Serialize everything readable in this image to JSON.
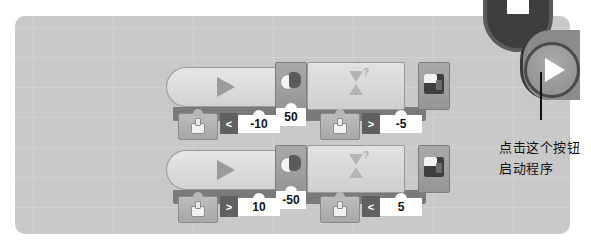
{
  "window": {
    "description": "Graphical robot programming canvas with two looping rows of blocks"
  },
  "program": {
    "rows": [
      {
        "start_block": {
          "icon": "play-triangle-icon"
        },
        "sensor_condition": {
          "icon": "sensor-icon",
          "operator": "<",
          "value": "-10"
        },
        "motor_block": {
          "icon": "motor-icon",
          "power": "50"
        },
        "wait_block": {
          "icon": "hourglass-question-icon",
          "sensor_icon": "sensor-icon",
          "operator": ">",
          "value": "-5"
        },
        "brick_block": {
          "icon": "brick-icon"
        }
      },
      {
        "start_block": {
          "icon": "play-triangle-icon"
        },
        "sensor_condition": {
          "icon": "sensor-icon",
          "operator": ">",
          "value": "10"
        },
        "motor_block": {
          "icon": "motor-icon",
          "power": "-50"
        },
        "wait_block": {
          "icon": "hourglass-question-icon",
          "sensor_icon": "sensor-icon",
          "operator": "<",
          "value": "5"
        },
        "brick_block": {
          "icon": "brick-icon"
        }
      }
    ]
  },
  "controls": {
    "run_button": {
      "icon": "play-icon"
    },
    "stop_button": {
      "icon": "stop-icon"
    }
  },
  "annotation": {
    "line1": "点击这个按钮",
    "line2": "启动程序"
  },
  "colors": {
    "canvas": "#c9c9c9",
    "block_light": "#dcdcdc",
    "block_dark": "#9e9e9e",
    "strip": "#7a7a7a",
    "run_button": "#9a9a9a"
  }
}
